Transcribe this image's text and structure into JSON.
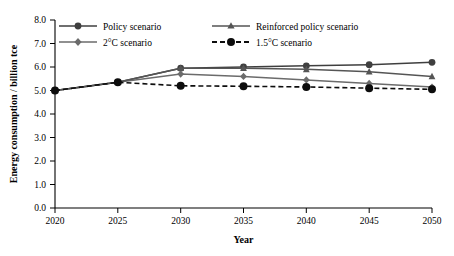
{
  "chart_data": {
    "type": "line",
    "title": "",
    "xlabel": "Year",
    "ylabel": "Energy consumption / billion tce",
    "x": [
      2020,
      2025,
      2030,
      2035,
      2040,
      2045,
      2050
    ],
    "xlim": [
      2020,
      2050
    ],
    "ylim": [
      0.0,
      8.0
    ],
    "xticks": [
      "2020",
      "2025",
      "2030",
      "2035",
      "2040",
      "2045",
      "2050"
    ],
    "yticks": [
      "0.0",
      "1.0",
      "2.0",
      "3.0",
      "4.0",
      "5.0",
      "6.0",
      "7.0",
      "8.0"
    ],
    "grid": false,
    "legend_position": "top-inside",
    "series": [
      {
        "name": "Policy scenario",
        "marker": "circle",
        "dash": false,
        "color": "#3f3f3f",
        "values": [
          5.0,
          5.35,
          5.95,
          6.0,
          6.05,
          6.1,
          6.2
        ]
      },
      {
        "name": "2°C scenario",
        "marker": "diamond",
        "dash": false,
        "color": "#6b6b6b",
        "values": [
          5.0,
          5.35,
          5.7,
          5.6,
          5.45,
          5.3,
          5.15
        ]
      },
      {
        "name": "Reinforced policy scenario",
        "marker": "triangle",
        "dash": false,
        "color": "#555555",
        "values": [
          5.0,
          5.35,
          5.95,
          5.95,
          5.9,
          5.8,
          5.6
        ]
      },
      {
        "name": "1.5°C scenario",
        "marker": "circle",
        "dash": true,
        "color": "#0d0d0d",
        "values": [
          5.0,
          5.35,
          5.2,
          5.18,
          5.15,
          5.1,
          5.05
        ]
      }
    ]
  },
  "legend": {
    "entries": [
      {
        "label": "Policy scenario"
      },
      {
        "label": "Reinforced policy scenario"
      },
      {
        "label": "2°C scenario"
      },
      {
        "label": "1.5°C scenario"
      }
    ]
  }
}
